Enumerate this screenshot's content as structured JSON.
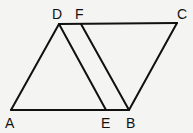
{
  "diagram": {
    "type": "geometry",
    "colors": {
      "background": "#f4f4f2",
      "line": "#111111"
    },
    "points": {
      "A": {
        "label": "A",
        "x": 11,
        "y": 110
      },
      "B": {
        "label": "B",
        "x": 129,
        "y": 110
      },
      "C": {
        "label": "C",
        "x": 177,
        "y": 23
      },
      "D": {
        "label": "D",
        "x": 59,
        "y": 24
      },
      "E": {
        "label": "E",
        "x": 106,
        "y": 110
      },
      "F": {
        "label": "F",
        "x": 81,
        "y": 24
      }
    },
    "segments": [
      [
        "A",
        "B"
      ],
      [
        "A",
        "D"
      ],
      [
        "D",
        "C"
      ],
      [
        "B",
        "C"
      ],
      [
        "D",
        "E"
      ],
      [
        "F",
        "B"
      ]
    ]
  }
}
